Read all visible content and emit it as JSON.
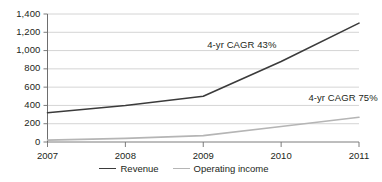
{
  "chart_data": {
    "type": "line",
    "title": "",
    "xlabel": "",
    "ylabel": "",
    "x": [
      2007,
      2008,
      2009,
      2010,
      2011
    ],
    "categories": [
      "2007",
      "2008",
      "2009",
      "2010",
      "2011"
    ],
    "ylim": [
      0,
      1400
    ],
    "ytick_values": [
      0,
      200,
      400,
      600,
      800,
      1000,
      1200,
      1400
    ],
    "ytick_labels": [
      "0",
      "200",
      "400",
      "600",
      "800",
      "1,000",
      "1,200",
      "1,400"
    ],
    "grid": true,
    "legend_position": "bottom-center",
    "series": [
      {
        "name": "Revenue",
        "values": [
          320,
          400,
          500,
          880,
          1300
        ],
        "color": "#3b3b3b",
        "width": 1.6
      },
      {
        "name": "Operating income",
        "values": [
          20,
          40,
          70,
          170,
          270
        ],
        "color": "#b5b5b5",
        "width": 1.6
      }
    ],
    "annotations": [
      {
        "text": "4-yr CAGR 43%",
        "x": 2009.05,
        "y": 1060
      },
      {
        "text": "4-yr CAGR 75%",
        "x": 2010.35,
        "y": 480
      }
    ]
  },
  "legend": {
    "items": [
      {
        "label": "Revenue",
        "color": "#3b3b3b"
      },
      {
        "label": "Operating income",
        "color": "#b5b5b5"
      }
    ]
  },
  "colors": {
    "revenue": "#3b3b3b",
    "operating_income": "#b5b5b5",
    "gridline": "#c9c9c9",
    "axis": "#6e6e6e",
    "text": "#231f20",
    "background": "#ffffff"
  }
}
